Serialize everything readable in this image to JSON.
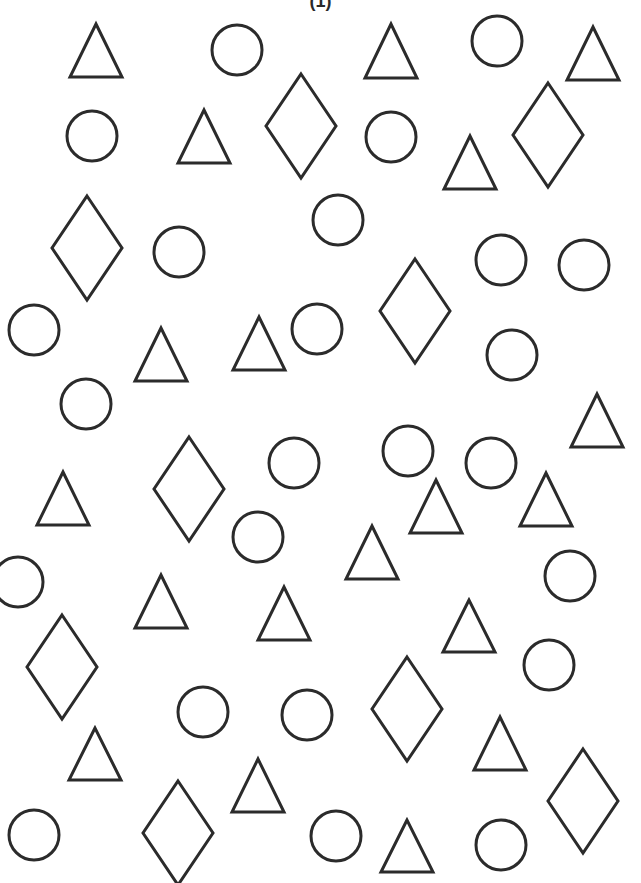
{
  "worksheet": {
    "label": "(1)",
    "stroke_color": "#2b2b2b",
    "background": "#ffffff",
    "counts": {
      "triangles": 19,
      "circles": 24,
      "diamonds": 9
    },
    "triangles": [
      {
        "cx": 96,
        "top": 24,
        "base": 77
      },
      {
        "cx": 391,
        "top": 24,
        "base": 78
      },
      {
        "cx": 593,
        "top": 27,
        "base": 80
      },
      {
        "cx": 204,
        "top": 110,
        "base": 163
      },
      {
        "cx": 470,
        "top": 136,
        "base": 189
      },
      {
        "cx": 161,
        "top": 328,
        "base": 381
      },
      {
        "cx": 259,
        "top": 317,
        "base": 370
      },
      {
        "cx": 597,
        "top": 394,
        "base": 447
      },
      {
        "cx": 63,
        "top": 472,
        "base": 525
      },
      {
        "cx": 436,
        "top": 480,
        "base": 533
      },
      {
        "cx": 546,
        "top": 473,
        "base": 526
      },
      {
        "cx": 372,
        "top": 526,
        "base": 579
      },
      {
        "cx": 161,
        "top": 575,
        "base": 628
      },
      {
        "cx": 284,
        "top": 587,
        "base": 640
      },
      {
        "cx": 469,
        "top": 600,
        "base": 652
      },
      {
        "cx": 95,
        "top": 728,
        "base": 780
      },
      {
        "cx": 500,
        "top": 717,
        "base": 770
      },
      {
        "cx": 258,
        "top": 759,
        "base": 812
      },
      {
        "cx": 407,
        "top": 820,
        "base": 872
      }
    ],
    "circles": [
      {
        "cx": 237,
        "cy": 50
      },
      {
        "cx": 497,
        "cy": 41
      },
      {
        "cx": 92,
        "cy": 136
      },
      {
        "cx": 391,
        "cy": 137
      },
      {
        "cx": 179,
        "cy": 252
      },
      {
        "cx": 338,
        "cy": 220
      },
      {
        "cx": 501,
        "cy": 260
      },
      {
        "cx": 584,
        "cy": 265
      },
      {
        "cx": 34,
        "cy": 330
      },
      {
        "cx": 317,
        "cy": 329
      },
      {
        "cx": 512,
        "cy": 355
      },
      {
        "cx": 86,
        "cy": 404
      },
      {
        "cx": 294,
        "cy": 463
      },
      {
        "cx": 408,
        "cy": 451
      },
      {
        "cx": 491,
        "cy": 463
      },
      {
        "cx": 258,
        "cy": 537
      },
      {
        "cx": 18,
        "cy": 582
      },
      {
        "cx": 570,
        "cy": 576
      },
      {
        "cx": 549,
        "cy": 665
      },
      {
        "cx": 203,
        "cy": 712
      },
      {
        "cx": 307,
        "cy": 715
      },
      {
        "cx": 34,
        "cy": 835
      },
      {
        "cx": 336,
        "cy": 836
      },
      {
        "cx": 501,
        "cy": 845
      }
    ],
    "diamonds": [
      {
        "cx": 301,
        "cy": 126
      },
      {
        "cx": 548,
        "cy": 135
      },
      {
        "cx": 87,
        "cy": 248
      },
      {
        "cx": 415,
        "cy": 311
      },
      {
        "cx": 189,
        "cy": 489
      },
      {
        "cx": 62,
        "cy": 667
      },
      {
        "cx": 407,
        "cy": 709
      },
      {
        "cx": 583,
        "cy": 801
      },
      {
        "cx": 178,
        "cy": 833
      }
    ],
    "sizes": {
      "triangle_half_width": 26,
      "circle_radius": 25,
      "diamond_half_width": 35,
      "diamond_half_height": 52
    }
  }
}
